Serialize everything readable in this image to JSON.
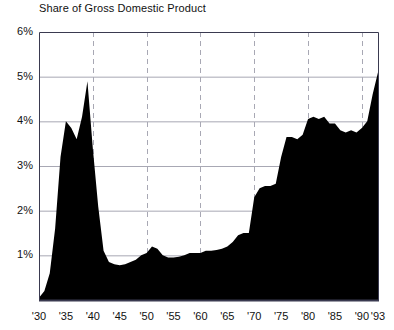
{
  "chart_data": {
    "type": "area",
    "title": "Share of Gross Domestic Product",
    "xlabel": "",
    "ylabel": "",
    "ylim": [
      0,
      6
    ],
    "xlim": [
      1930,
      1993
    ],
    "grid": "horizontal solid at each 1% tick; vertical dashed every 10 years",
    "legend": "none",
    "y_tick_labels": [
      "6%",
      "5%",
      "4%",
      "3%",
      "2%",
      "1%"
    ],
    "y_tick_values": [
      6,
      5,
      4,
      3,
      2,
      1
    ],
    "x_tick_labels": [
      "'30",
      "'35",
      "'40",
      "'45",
      "'50",
      "'55",
      "'60",
      "'65",
      "'70",
      "'75",
      "'80",
      "'85",
      "'90",
      "'93"
    ],
    "x_tick_values": [
      1930,
      1935,
      1940,
      1945,
      1950,
      1955,
      1960,
      1965,
      1970,
      1975,
      1980,
      1985,
      1990,
      1993
    ],
    "vertical_gridline_years": [
      1940,
      1950,
      1960,
      1970,
      1980,
      1990
    ],
    "series": [
      {
        "name": "Share of Gross Domestic Product",
        "fill_color": "#000000",
        "x": [
          1930,
          1931,
          1932,
          1933,
          1934,
          1935,
          1936,
          1937,
          1938,
          1939,
          1940,
          1941,
          1942,
          1943,
          1944,
          1945,
          1946,
          1947,
          1948,
          1949,
          1950,
          1951,
          1952,
          1953,
          1954,
          1955,
          1956,
          1957,
          1958,
          1959,
          1960,
          1961,
          1962,
          1963,
          1964,
          1965,
          1966,
          1967,
          1968,
          1969,
          1970,
          1971,
          1972,
          1973,
          1974,
          1975,
          1976,
          1977,
          1978,
          1979,
          1980,
          1981,
          1982,
          1983,
          1984,
          1985,
          1986,
          1987,
          1988,
          1989,
          1990,
          1991,
          1992,
          1993
        ],
        "values": [
          0.05,
          0.2,
          0.6,
          1.6,
          3.2,
          4.0,
          3.85,
          3.6,
          4.1,
          4.9,
          3.4,
          2.1,
          1.1,
          0.85,
          0.8,
          0.78,
          0.8,
          0.85,
          0.9,
          1.0,
          1.05,
          1.2,
          1.15,
          1.0,
          0.95,
          0.95,
          0.97,
          1.0,
          1.05,
          1.05,
          1.05,
          1.1,
          1.1,
          1.12,
          1.15,
          1.2,
          1.3,
          1.45,
          1.5,
          1.5,
          2.3,
          2.5,
          2.55,
          2.55,
          2.6,
          3.2,
          3.65,
          3.65,
          3.6,
          3.7,
          4.05,
          4.1,
          4.05,
          4.1,
          3.95,
          3.95,
          3.8,
          3.75,
          3.8,
          3.75,
          3.85,
          4.0,
          4.6,
          5.1
        ]
      }
    ]
  },
  "axes": {
    "plot_left": 39,
    "plot_top": 32,
    "plot_right": 378,
    "plot_bottom": 300,
    "axis_color": "#3a3a50",
    "gridline_color": "#a8a8b4"
  }
}
